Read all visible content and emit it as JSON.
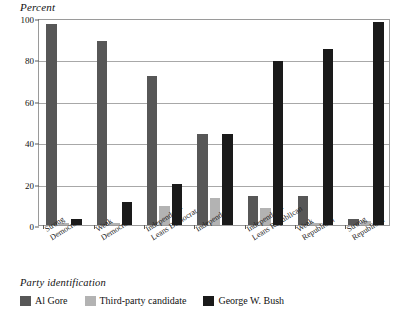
{
  "chart_data": {
    "type": "bar",
    "title": "",
    "xlabel": "Party identification",
    "ylabel": "Percent",
    "ylim": [
      0,
      100
    ],
    "yticks": [
      0,
      20,
      40,
      60,
      80,
      100
    ],
    "grid": true,
    "legend_position": "bottom",
    "categories": [
      "Strong\nDemocrat",
      "Weak\nDemocrat",
      "Independent-\nLeans Democrat",
      "Independent",
      "Independent-\nLeans Republican",
      "Weak\nRepublican",
      "Strong\nRepublican"
    ],
    "series": [
      {
        "name": "Al Gore",
        "color": "#575757",
        "values": [
          97,
          89,
          72,
          44,
          14,
          14,
          3
        ]
      },
      {
        "name": "Third-party candidate",
        "color": "#b3b3b3",
        "values": [
          1,
          1,
          9,
          13,
          8,
          1,
          2
        ]
      },
      {
        "name": "George W. Bush",
        "color": "#1a1a1a",
        "values": [
          3,
          11,
          20,
          44,
          79,
          85,
          98
        ]
      }
    ]
  },
  "axis": {
    "y_title": "Percent",
    "tick_labels": [
      "100",
      "80",
      "60",
      "40",
      "20",
      "0"
    ]
  },
  "legend": {
    "title": "Party identification",
    "items": [
      {
        "label": "Al Gore",
        "color": "#575757"
      },
      {
        "label": "Third-party candidate",
        "color": "#b3b3b3"
      },
      {
        "label": "George W. Bush",
        "color": "#1a1a1a"
      }
    ]
  }
}
